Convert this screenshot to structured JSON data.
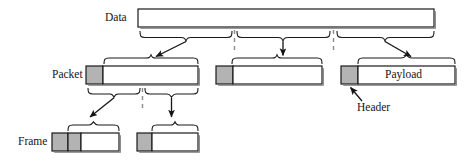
{
  "diagram": {
    "type": "encapsulation-hierarchy",
    "colors": {
      "header_fill": "#b3b3b3",
      "payload_fill": "#ffffff",
      "stroke": "#1a1a1a",
      "dashed": "#808080",
      "background": "#ffffff"
    },
    "labels": {
      "data": "Data",
      "packet": "Packet",
      "frame": "Frame",
      "payload": "Payload",
      "header": "Header"
    },
    "rows": [
      {
        "name": "data-row",
        "label": "Data",
        "boxes": [
          {
            "name": "data-box",
            "segments": [
              {
                "kind": "payload",
                "text": ""
              }
            ]
          }
        ]
      },
      {
        "name": "packet-row",
        "label": "Packet",
        "boxes": [
          {
            "name": "packet-box-1",
            "segments": [
              {
                "kind": "header",
                "text": ""
              },
              {
                "kind": "payload",
                "text": ""
              }
            ]
          },
          {
            "name": "packet-box-2",
            "segments": [
              {
                "kind": "header",
                "text": ""
              },
              {
                "kind": "payload",
                "text": ""
              }
            ]
          },
          {
            "name": "packet-box-3",
            "segments": [
              {
                "kind": "header",
                "text": ""
              },
              {
                "kind": "payload",
                "text": "Payload"
              }
            ]
          }
        ]
      },
      {
        "name": "frame-row",
        "label": "Frame",
        "boxes": [
          {
            "name": "frame-box-1",
            "segments": [
              {
                "kind": "header",
                "text": ""
              },
              {
                "kind": "header",
                "text": ""
              },
              {
                "kind": "payload",
                "text": ""
              }
            ]
          },
          {
            "name": "frame-box-2",
            "segments": [
              {
                "kind": "header",
                "text": ""
              },
              {
                "kind": "payload",
                "text": ""
              }
            ]
          }
        ]
      }
    ],
    "annotations": [
      {
        "name": "header-callout",
        "text": "Header",
        "points_to": "packet-box-3-header"
      }
    ]
  }
}
